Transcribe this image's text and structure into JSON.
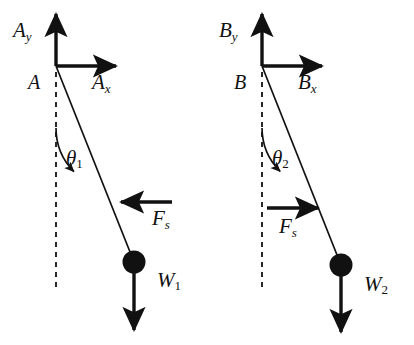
{
  "figure": {
    "background_color": "#ffffff",
    "stroke_color": "#111111",
    "width": 414,
    "height": 345
  },
  "panels": [
    {
      "id": "panel-a",
      "pivot_label": "A",
      "vertical_component_label": "A",
      "vertical_component_sub": "y",
      "horizontal_component_label": "A",
      "horizontal_component_sub": "x",
      "angle_label": "θ",
      "angle_sub": "1",
      "spring_force_label": "F",
      "spring_force_sub": "s",
      "spring_force_direction": "left",
      "weight_label": "W",
      "weight_sub": "1",
      "geometry": {
        "pivot_x": 56,
        "pivot_y": 66,
        "vertical_arrow_tip_y": 10,
        "horizontal_arrow_tip_x": 120,
        "dashed_line_bottom_y": 288,
        "bob_x": 134,
        "bob_y": 262,
        "bob_radius": 11,
        "weight_arrow_tip_y": 336,
        "spring_arrow_y": 202,
        "spring_arrow_tail_x": 172,
        "spring_arrow_tip_x": 117,
        "arc_radius": 62
      },
      "label_positions": {
        "pivot": {
          "x": 28,
          "y": 73
        },
        "vertical": {
          "x": 13,
          "y": 22
        },
        "horizontal": {
          "x": 90,
          "y": 73
        },
        "angle": {
          "x": 66,
          "y": 148
        },
        "spring": {
          "x": 152,
          "y": 208
        },
        "weight": {
          "x": 157,
          "y": 270
        }
      }
    },
    {
      "id": "panel-b",
      "pivot_label": "B",
      "vertical_component_label": "B",
      "vertical_component_sub": "y",
      "horizontal_component_label": "B",
      "horizontal_component_sub": "x",
      "angle_label": "θ",
      "angle_sub": "2",
      "spring_force_label": "F",
      "spring_force_sub": "s",
      "spring_force_direction": "right",
      "weight_label": "W",
      "weight_sub": "2",
      "geometry": {
        "pivot_x": 262,
        "pivot_y": 66,
        "vertical_arrow_tip_y": 10,
        "horizontal_arrow_tip_x": 326,
        "dashed_line_bottom_y": 290,
        "bob_x": 341,
        "bob_y": 265,
        "bob_radius": 11,
        "weight_arrow_tip_y": 338,
        "spring_arrow_y": 208,
        "spring_arrow_tail_x": 267,
        "spring_arrow_tip_x": 322,
        "arc_radius": 62
      },
      "label_positions": {
        "pivot": {
          "x": 234,
          "y": 73
        },
        "vertical": {
          "x": 219,
          "y": 22
        },
        "horizontal": {
          "x": 296,
          "y": 73
        },
        "angle": {
          "x": 272,
          "y": 148
        },
        "spring": {
          "x": 280,
          "y": 216
        },
        "weight": {
          "x": 364,
          "y": 274
        }
      }
    }
  ]
}
